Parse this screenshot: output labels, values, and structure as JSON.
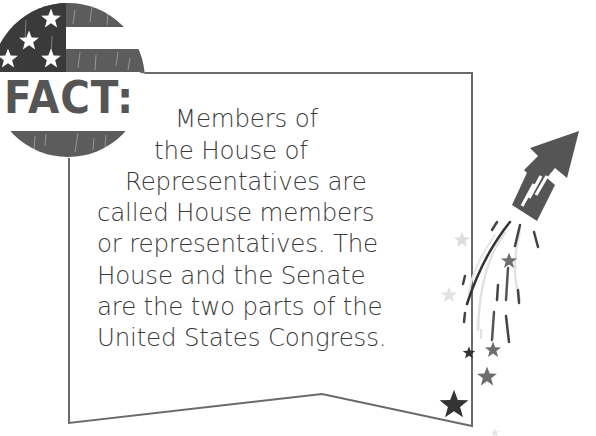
{
  "badge": {
    "label": "FACT:",
    "icon": "american-flag-icon"
  },
  "fact": {
    "lines": [
      "Members of",
      "the House of",
      "Representatives are",
      "called House members",
      "or representatives. The",
      "House and the Senate",
      "are the two parts of the",
      "United States Congress."
    ],
    "full_text": "Members of the House of Representatives are called House members or representatives. The House and the Senate are the two parts of the United States Congress."
  },
  "decorations": {
    "rocket": "firework-rocket-icon",
    "stars": "star-icon"
  },
  "colors": {
    "canton": "#3b3b3b",
    "stripe": "#5c5c5c",
    "label": "#555555",
    "text": "#3a3a3a",
    "outline": "#6a6a6a",
    "light_star": "#dddddd",
    "mid_star": "#6e6e6e",
    "dark_star": "#333333"
  }
}
